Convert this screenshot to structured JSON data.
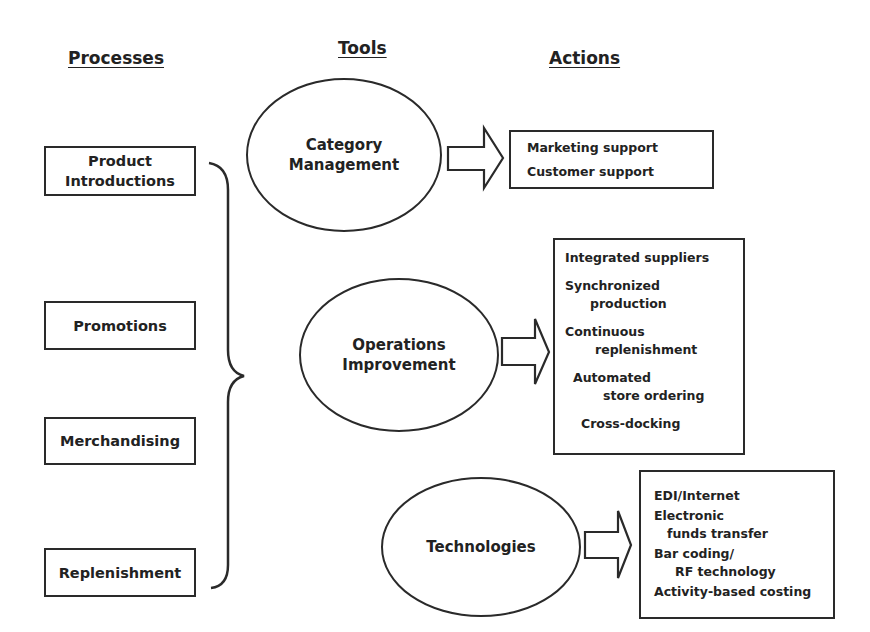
{
  "headers": {
    "processes": "Processes",
    "tools": "Tools",
    "actions": "Actions"
  },
  "processes": [
    {
      "line1": "Product",
      "line2": "Introductions"
    },
    {
      "label": "Promotions"
    },
    {
      "label": "Merchandising"
    },
    {
      "label": "Replenishment"
    }
  ],
  "tools": [
    {
      "line1": "Category",
      "line2": "Management"
    },
    {
      "line1": "Operations",
      "line2": "Improvement"
    },
    {
      "label": "Technologies"
    }
  ],
  "actions": {
    "category_management": [
      "Marketing support",
      "Customer support"
    ],
    "operations_improvement": [
      "Integrated suppliers",
      "Synchronized",
      "production",
      "Continuous",
      "replenishment",
      "Automated",
      "store ordering",
      "Cross-docking"
    ],
    "technologies": [
      "EDI/Internet",
      "Electronic",
      "funds transfer",
      "Bar coding/",
      "RF technology",
      "Activity-based costing"
    ]
  },
  "icons": {
    "brace": "right-curly-brace",
    "arrows": [
      "block-arrow-right",
      "block-arrow-right",
      "block-arrow-right"
    ]
  }
}
